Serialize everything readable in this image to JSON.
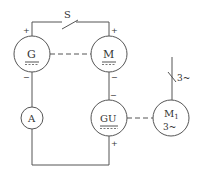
{
  "diagram": {
    "type": "circuit-schematic",
    "components": {
      "switch": {
        "label": "S"
      },
      "generator": {
        "label": "G",
        "subscript": "==="
      },
      "motor": {
        "label": "M",
        "subscript": "==="
      },
      "ammeter": {
        "label": "A"
      },
      "exciter": {
        "label": "GU",
        "subscript": "==="
      },
      "drive_motor": {
        "label": "M",
        "label_sub": "1",
        "label2": "3~"
      }
    },
    "supply": {
      "label": "3~"
    },
    "polarity": {
      "g_top": "+",
      "g_bottom": "−",
      "m_top": "+",
      "m_bottom": "−",
      "gu_top": "−",
      "gu_bottom": "+"
    },
    "colors": {
      "line": "#555555",
      "text": "#333333"
    }
  }
}
